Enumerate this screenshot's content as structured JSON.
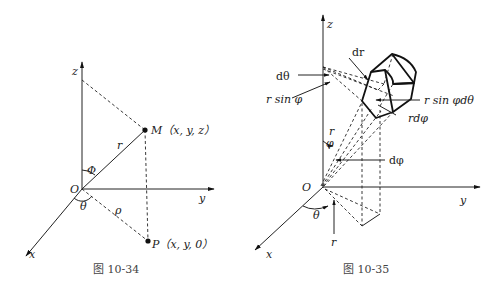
{
  "figures": [
    {
      "caption": "图 10-34",
      "labels": {
        "z": "z",
        "y": "y",
        "x": "x",
        "origin": "O",
        "point_m": "M（x, y, z）",
        "point_p": "P（x, y, 0）",
        "r": "r",
        "rho": "ρ",
        "phi": "Φ",
        "theta": "θ"
      }
    },
    {
      "caption": "图 10-35",
      "labels": {
        "z": "z",
        "y": "y",
        "x": "x",
        "origin": "O",
        "dr": "dr",
        "dtheta": "dθ",
        "r_sin_phi": "r sin φ",
        "r_sin_phi_dtheta": "r sin φdθ",
        "r_dphi": "rdφ",
        "r_upper": "r",
        "phi": "φ",
        "dphi": "dφ",
        "theta": "θ",
        "r_lower": "r"
      }
    }
  ]
}
